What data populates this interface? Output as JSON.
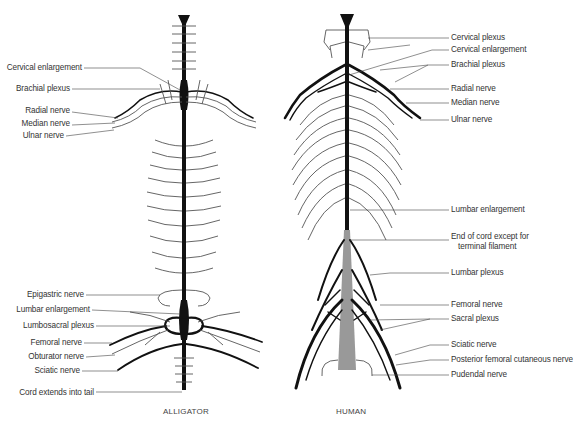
{
  "diagram": {
    "panels": [
      {
        "caption": "ALLIGATOR",
        "labels": [
          {
            "text": "Cervical enlargement",
            "y": 68
          },
          {
            "text": "Brachial plexus",
            "y": 89
          },
          {
            "text": "Radial nerve",
            "y": 111
          },
          {
            "text": "Median nerve",
            "y": 124
          },
          {
            "text": "Ulnar nerve",
            "y": 135
          },
          {
            "text": "Epigastric nerve",
            "y": 294
          },
          {
            "text": "Lumbar enlargement",
            "y": 309
          },
          {
            "text": "Lumbosacral plexus",
            "y": 325
          },
          {
            "text": "Femoral nerve",
            "y": 342
          },
          {
            "text": "Obturator nerve",
            "y": 356
          },
          {
            "text": "Sciatic nerve",
            "y": 370
          },
          {
            "text": "Cord extends into tail",
            "y": 392
          }
        ]
      },
      {
        "caption": "HUMAN",
        "labels": [
          {
            "text": "Cervical plexus",
            "y": 38
          },
          {
            "text": "Cervical enlargement",
            "y": 50
          },
          {
            "text": "Brachial plexus",
            "y": 65
          },
          {
            "text": "Radial nerve",
            "y": 89
          },
          {
            "text": "Median nerve",
            "y": 103
          },
          {
            "text": "Ulnar nerve",
            "y": 120
          },
          {
            "text": "Lumbar enlargement",
            "y": 210
          },
          {
            "text": "End of cord except for",
            "y": 237
          },
          {
            "text": "terminal filament",
            "y": 247
          },
          {
            "text": "Lumbar plexus",
            "y": 273
          },
          {
            "text": "Femoral nerve",
            "y": 305
          },
          {
            "text": "Sacral plexus",
            "y": 319
          },
          {
            "text": "Sciatic nerve",
            "y": 345
          },
          {
            "text": "Posterior femoral cutaneous nerve",
            "y": 360
          },
          {
            "text": "Pudendal nerve",
            "y": 375
          }
        ]
      }
    ]
  }
}
